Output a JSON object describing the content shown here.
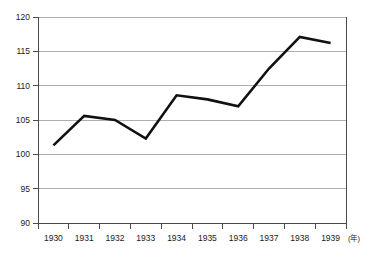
{
  "chart_data": {
    "type": "line",
    "title": "",
    "subtitle": "",
    "xlabel": "(年)",
    "ylabel": "",
    "categories": [
      "1930",
      "1931",
      "1932",
      "1933",
      "1934",
      "1935",
      "1936",
      "1937",
      "1938",
      "1939"
    ],
    "values": [
      101.3,
      105.6,
      105.0,
      102.3,
      108.6,
      108.0,
      107.0,
      112.5,
      117.1,
      116.2
    ],
    "series": [
      {
        "name": "index",
        "values": [
          101.3,
          105.6,
          105.0,
          102.3,
          108.6,
          108.0,
          107.0,
          112.5,
          117.1,
          116.2
        ]
      }
    ],
    "x_tick_labels": [
      "1930",
      "1931",
      "1932",
      "1933",
      "1934",
      "1935",
      "1936",
      "1937",
      "1938",
      "1939"
    ],
    "y_tick_labels": [
      "90",
      "95",
      "100",
      "105",
      "110",
      "115",
      "120"
    ],
    "y_ticks": [
      90,
      95,
      100,
      105,
      110,
      115,
      120
    ],
    "ylim": [
      90,
      120
    ],
    "xlim": [
      1929.5,
      1939.5
    ],
    "grid": true,
    "grid_axis": "y",
    "legend": false,
    "legend_position": "none",
    "line_color": "#111111",
    "grid_color": "#9a9a9a",
    "axis_color": "#4a4a4a",
    "background_color": "#ffffff",
    "annotations": [],
    "x_unit_suffix": "(年)"
  },
  "axis": {
    "y_labels": [
      "120",
      "115",
      "110",
      "105",
      "100",
      "95",
      "90"
    ],
    "x_labels": [
      "1930",
      "1931",
      "1932",
      "1933",
      "1934",
      "1935",
      "1936",
      "1937",
      "1938",
      "1939"
    ],
    "x_unit": "(年)"
  }
}
